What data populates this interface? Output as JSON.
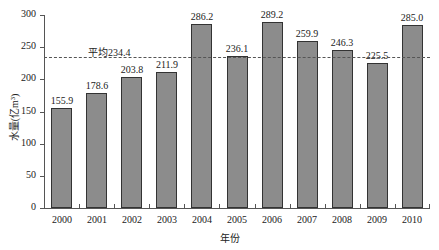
{
  "chart_data": {
    "type": "bar",
    "title": "",
    "xlabel": "年份",
    "ylabel": "水量(亿m³)",
    "ylim": [
      0,
      300
    ],
    "yticks": [
      0,
      50,
      100,
      150,
      200,
      250,
      300
    ],
    "categories": [
      "2000",
      "2001",
      "2002",
      "2003",
      "2004",
      "2005",
      "2006",
      "2007",
      "2008",
      "2009",
      "2010"
    ],
    "values": [
      155.9,
      178.6,
      203.8,
      211.9,
      286.2,
      236.1,
      289.2,
      259.9,
      246.3,
      225.5,
      285.0
    ],
    "value_labels": [
      "155.9",
      "178.6",
      "203.8",
      "211.9",
      "286.2",
      "236.1",
      "289.2",
      "259.9",
      "246.3",
      "225.5",
      "285.0"
    ],
    "reference_line": {
      "value": 234.4,
      "label": "平均234.4",
      "style": "dashed"
    },
    "grid": false,
    "legend": null,
    "bar_color": "#8c8c8c",
    "bar_edge_color": "#333333"
  }
}
